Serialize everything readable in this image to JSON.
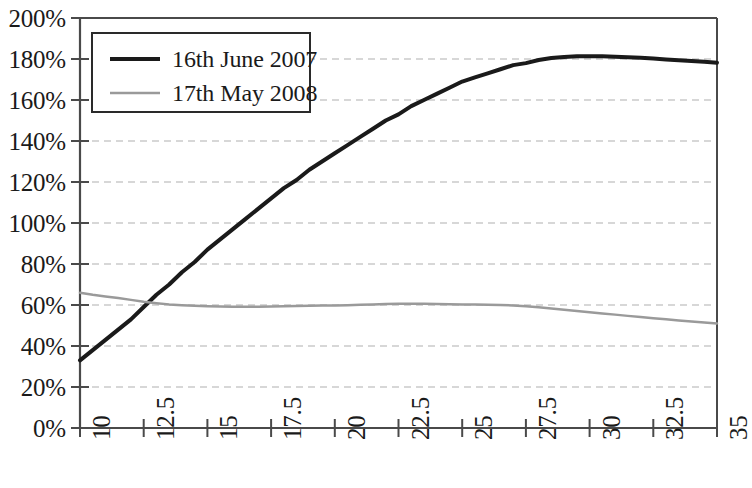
{
  "chart_data": {
    "type": "line",
    "title": "",
    "subtitle": "",
    "xlabel": "",
    "ylabel": "",
    "xlim": [
      10,
      35
    ],
    "ylim": [
      0,
      200
    ],
    "grid": true,
    "grid_style": "dashed-horizontal",
    "legend_position": "top-left-inside",
    "x_ticks": [
      "10",
      "12.5",
      "15",
      "17.5",
      "20",
      "22.5",
      "25",
      "27.5",
      "30",
      "32.5",
      "35"
    ],
    "x_tick_values": [
      10,
      12.5,
      15,
      17.5,
      20,
      22.5,
      25,
      27.5,
      30,
      32.5,
      35
    ],
    "y_ticks": [
      "0%",
      "20%",
      "40%",
      "60%",
      "80%",
      "100%",
      "120%",
      "140%",
      "160%",
      "180%",
      "200%"
    ],
    "y_tick_values": [
      0,
      20,
      40,
      60,
      80,
      100,
      120,
      140,
      160,
      180,
      200
    ],
    "x": [
      10,
      10.5,
      11,
      11.5,
      12,
      12.5,
      13,
      13.5,
      14,
      14.5,
      15,
      15.5,
      16,
      16.5,
      17,
      17.5,
      18,
      18.5,
      19,
      19.5,
      20,
      20.5,
      21,
      21.5,
      22,
      22.5,
      23,
      23.5,
      24,
      24.5,
      25,
      25.5,
      26,
      26.5,
      27,
      27.5,
      28,
      28.5,
      29,
      29.5,
      30,
      30.5,
      31,
      31.5,
      32,
      32.5,
      33,
      33.5,
      34,
      34.5,
      35
    ],
    "series": [
      {
        "name": "16th June 2007",
        "color": "#1a1a1a",
        "line_width": 4,
        "values": [
          33,
          38,
          43,
          48,
          53,
          59,
          65,
          70,
          76,
          81,
          87,
          92,
          97,
          102,
          107,
          112,
          117,
          121,
          126,
          130,
          134,
          138,
          142,
          146,
          150,
          153,
          157,
          160,
          163,
          166,
          169,
          171,
          173,
          175,
          177,
          178,
          179.5,
          180.5,
          181,
          181.3,
          181.4,
          181.3,
          181.1,
          180.9,
          180.6,
          180.2,
          179.8,
          179.4,
          179,
          178.6,
          178.2
        ]
      },
      {
        "name": "17th May 2008",
        "color": "#9a9a9a",
        "line_width": 2.5,
        "values": [
          66,
          65,
          64.2,
          63.4,
          62.5,
          61.6,
          60.9,
          60.3,
          59.9,
          59.6,
          59.4,
          59.3,
          59.2,
          59.2,
          59.2,
          59.3,
          59.4,
          59.5,
          59.6,
          59.7,
          59.8,
          59.9,
          60.1,
          60.3,
          60.5,
          60.6,
          60.6,
          60.6,
          60.5,
          60.4,
          60.3,
          60.2,
          60.1,
          60,
          59.8,
          59.4,
          58.9,
          58.3,
          57.7,
          57.1,
          56.5,
          55.9,
          55.3,
          54.7,
          54.1,
          53.5,
          53,
          52.5,
          52,
          51.5,
          51
        ]
      }
    ],
    "annotations": []
  },
  "legend": {
    "entries": [
      {
        "label": "16th June 2007"
      },
      {
        "label": "17th May 2008"
      }
    ]
  },
  "colors": {
    "series_1": "#1a1a1a",
    "series_2": "#9a9a9a",
    "grid": "#b0b0b0",
    "axis": "#4a4a4a",
    "background": "#ffffff"
  }
}
